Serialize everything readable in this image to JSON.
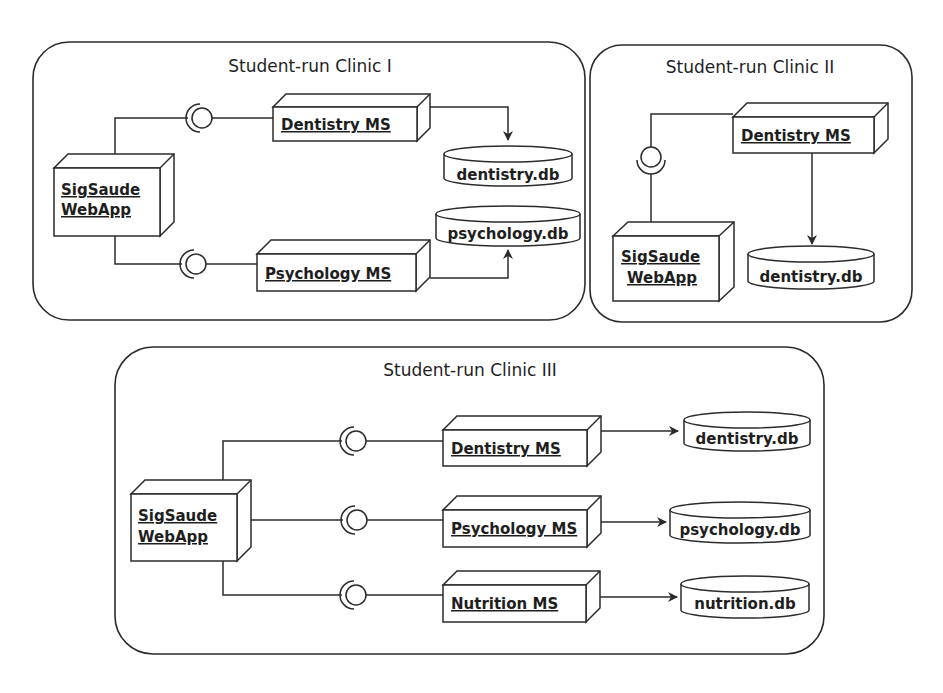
{
  "diagram": {
    "type": "uml-deployment",
    "colors": {
      "stroke": "#2b2b2b",
      "text": "#1e1e1e",
      "background": "#ffffff"
    },
    "clinics": [
      {
        "title": "Student-run Clinic I",
        "nodes": {
          "webapp": "SigSaude WebApp",
          "services": [
            "Dentistry MS",
            "Psychology MS"
          ]
        },
        "databases": [
          "dentistry.db",
          "psychology.db"
        ]
      },
      {
        "title": "Student-run Clinic II",
        "nodes": {
          "webapp": "SigSaude WebApp",
          "services": [
            "Dentistry MS"
          ]
        },
        "databases": [
          "dentistry.db"
        ]
      },
      {
        "title": "Student-run Clinic III",
        "nodes": {
          "webapp": "SigSaude WebApp",
          "services": [
            "Dentistry MS",
            "Psychology MS",
            "Nutrition MS"
          ]
        },
        "databases": [
          "dentistry.db",
          "psychology.db",
          "nutrition.db"
        ]
      }
    ],
    "labels": {
      "webapp_line1": "SigSaude",
      "webapp_line2": "WebApp"
    }
  }
}
